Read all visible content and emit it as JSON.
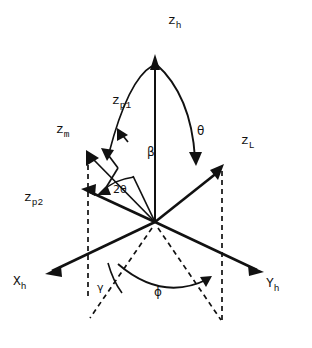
{
  "figure": {
    "title": "",
    "type": "3d-vector-coordinate-diagram",
    "background_color": "#ffffff",
    "ink_color": "#111111"
  },
  "axes": [
    {
      "id": "z_h",
      "base": "z",
      "sub": "h",
      "label_x": 168,
      "label_y": 21,
      "tip_x": 155,
      "tip_y": 57,
      "style": "solid-arrow"
    },
    {
      "id": "z_p1",
      "base": "z",
      "sub": "p1",
      "label_x": 112,
      "label_y": 101,
      "tip_x": 117,
      "tip_y": 127,
      "style": "solid-arrow-short"
    },
    {
      "id": "z_m",
      "base": "z",
      "sub": "m",
      "label_x": 56,
      "label_y": 130,
      "tip_x": 88,
      "tip_y": 152,
      "style": "solid-arrow"
    },
    {
      "id": "z_p2",
      "base": "z",
      "sub": "p2",
      "label_x": 24,
      "label_y": 198,
      "tip_x": 83,
      "tip_y": 189,
      "style": "solid-arrow"
    },
    {
      "id": "z_L",
      "base": "z",
      "sub": "L",
      "label_x": 241,
      "label_y": 141,
      "tip_x": 222,
      "tip_y": 165,
      "style": "solid-arrow"
    },
    {
      "id": "X_h",
      "base": "X",
      "sub": "h",
      "label_x": 13,
      "label_y": 282,
      "tip_x": 47,
      "tip_y": 273,
      "style": "solid-arrow"
    },
    {
      "id": "Y_h",
      "base": "Y",
      "sub": "h",
      "label_x": 266,
      "label_y": 284,
      "tip_x": 262,
      "tip_y": 272,
      "style": "solid-arrow"
    }
  ],
  "angles": [
    {
      "id": "theta",
      "symbol": "θ",
      "label_x": 197,
      "label_y": 131,
      "between": [
        "z_h",
        "z_L"
      ]
    },
    {
      "id": "beta",
      "symbol": "β",
      "label_x": 147,
      "label_y": 152,
      "between": [
        "z_h",
        "z_m"
      ]
    },
    {
      "id": "two-theta",
      "symbol": "2θ",
      "label_x": 113,
      "label_y": 190,
      "between": [
        "z_p1",
        "z_p2"
      ]
    },
    {
      "id": "gamma",
      "symbol": "γ",
      "label_x": 97,
      "label_y": 288,
      "between": [
        "X_h",
        "z_m-projection"
      ]
    },
    {
      "id": "phi",
      "symbol": "ϕ",
      "label_x": 154,
      "label_y": 292,
      "between": [
        "z_L-projection",
        "z_m-projection"
      ]
    }
  ],
  "origin": {
    "x": 155,
    "y": 222
  },
  "projection_lines": [
    {
      "id": "z_m-vertical-drop",
      "x1": 88,
      "y1": 155,
      "x2": 88,
      "y2": 295,
      "style": "dashed"
    },
    {
      "id": "z_L-vertical-drop",
      "x1": 222,
      "y1": 170,
      "x2": 222,
      "y2": 320,
      "style": "dashed"
    },
    {
      "id": "origin-to-left-foot",
      "x1": 155,
      "y1": 226,
      "x2": 88,
      "y2": 320,
      "style": "dashed"
    },
    {
      "id": "origin-to-right-foot",
      "x1": 155,
      "y1": 226,
      "x2": 222,
      "y2": 320,
      "style": "dashed"
    }
  ]
}
